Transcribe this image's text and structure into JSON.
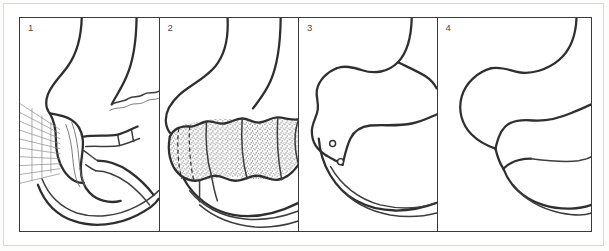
{
  "figure": {
    "kind": "multi-panel-line-illustration",
    "panel_count": 4,
    "background_color": "#ffffff",
    "ink_color": "#2f2f2f",
    "frame_color": "#3a3a3a",
    "panels": [
      {
        "number": "1",
        "caption": "",
        "features": [
          "radiating-hatch-lines",
          "anatomical-outline",
          "tubular-structure"
        ]
      },
      {
        "number": "2",
        "caption": "",
        "features": [
          "stippled-segmented-tube",
          "dashed-resection-marks",
          "anatomical-outline"
        ]
      },
      {
        "number": "3",
        "caption": "",
        "features": [
          "anatomical-outline",
          "suture-knot-upper",
          "suture-knot-lower"
        ]
      },
      {
        "number": "4",
        "caption": "",
        "features": [
          "anatomical-outline",
          "closed-junction"
        ]
      }
    ]
  }
}
